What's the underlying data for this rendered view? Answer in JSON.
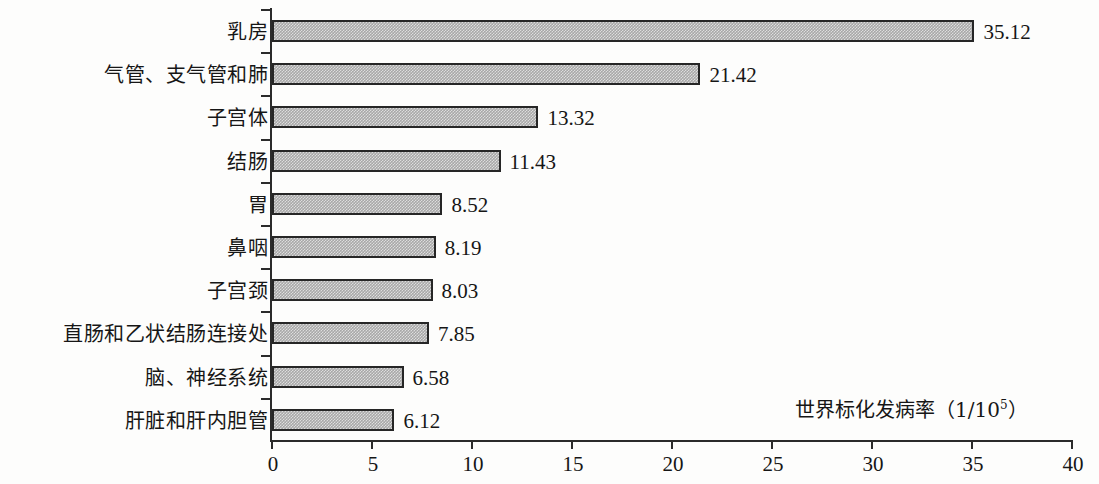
{
  "chart_data": {
    "type": "bar",
    "orientation": "horizontal",
    "title": "",
    "xlabel": "世界标化发病率（1/10⁵）",
    "ylabel": "",
    "xlim": [
      0,
      40
    ],
    "xticks": [
      "0",
      "5",
      "10",
      "15",
      "20",
      "25",
      "30",
      "35",
      "40"
    ],
    "xtick_values": [
      0,
      5,
      10,
      15,
      20,
      25,
      30,
      35,
      40
    ],
    "grid": false,
    "legend": false,
    "categories": [
      "乳房",
      "气管、支气管和肺",
      "子宫体",
      "结肠",
      "胃",
      "鼻咽",
      "子宫颈",
      "直肠和乙状结肠连接处",
      "脑、神经系统",
      "肝脏和肝内胆管"
    ],
    "values": [
      35.12,
      21.42,
      13.32,
      11.43,
      8.52,
      8.19,
      8.03,
      7.85,
      6.58,
      6.12
    ],
    "value_labels": [
      "35.12",
      "21.42",
      "13.32",
      "11.43",
      "8.52",
      "8.19",
      "8.03",
      "7.85",
      "6.58",
      "6.12"
    ],
    "bar_fill_color": "#a8a8a8",
    "bar_border_color": "#262626",
    "axis_color": "#2b2b2b",
    "background_color": "#fdfdfc",
    "text_color": "#161616"
  },
  "axis_title": {
    "text_main": "世界标化发病率（1/10",
    "superscript": "5",
    "text_tail": "）"
  }
}
